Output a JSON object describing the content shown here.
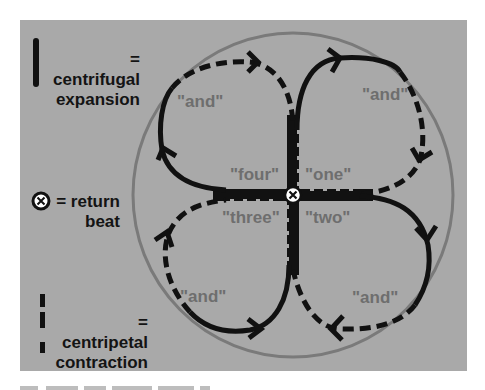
{
  "legend": {
    "expansion": {
      "symbol": "solid-line",
      "label_line1": "= centrifugal",
      "label_line2": "expansion"
    },
    "return_beat": {
      "symbol": "x-circle",
      "label_line1": "= return",
      "label_line2": "beat"
    },
    "contraction": {
      "symbol": "dashed-line",
      "label_line1": "= centripetal",
      "label_line2": "contraction"
    }
  },
  "beats": {
    "center": {
      "one": "\"one\"",
      "two": "\"two\"",
      "three": "\"three\"",
      "four": "\"four\""
    },
    "offbeats": {
      "top_left": "\"and\"",
      "top_right": "\"and\"",
      "bottom_right": "\"and\"",
      "bottom_left": "\"and\""
    }
  },
  "colors": {
    "panel": "#a9a9a9",
    "stroke": "#111111",
    "outer_circle": "#7a7a7a",
    "beat_text": "#6e6e6e",
    "legend_text": "#141414"
  }
}
